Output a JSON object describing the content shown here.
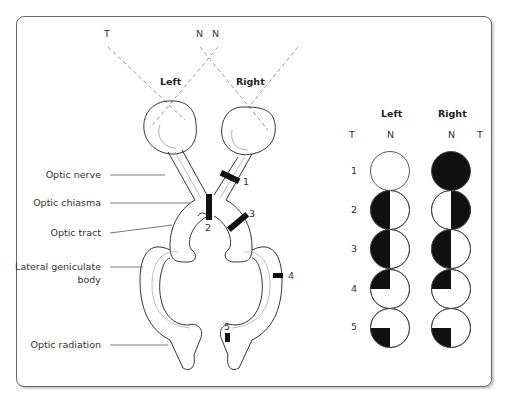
{
  "diagram": {
    "field_labels": {
      "t_left": "T",
      "n_left": "N",
      "n_right": "N"
    },
    "eye_labels": {
      "left": "Left",
      "right": "Right"
    },
    "structures": [
      {
        "label": "Optic nerve"
      },
      {
        "label": "Optic chiasma"
      },
      {
        "label": "Optic tract"
      },
      {
        "label": "Lateral geniculate",
        "label2": "body"
      },
      {
        "label": "Optic radiation"
      }
    ],
    "lesions": [
      "1",
      "2",
      "3",
      "4",
      "5"
    ]
  },
  "visual_fields": {
    "headers": {
      "left": "Left",
      "right": "Right",
      "t1": "T",
      "n1": "N",
      "n2": "N",
      "t2": "T"
    },
    "rows": [
      {
        "num": "1",
        "left": "none",
        "right": "full"
      },
      {
        "num": "2",
        "left": "temporal-half",
        "right": "temporal-half"
      },
      {
        "num": "3",
        "left": "left-half",
        "right": "left-half"
      },
      {
        "num": "4",
        "left": "upper-left-quadrant",
        "right": "upper-left-quadrant"
      },
      {
        "num": "5",
        "left": "lower-left-quadrant",
        "right": "lower-left-quadrant"
      }
    ]
  }
}
